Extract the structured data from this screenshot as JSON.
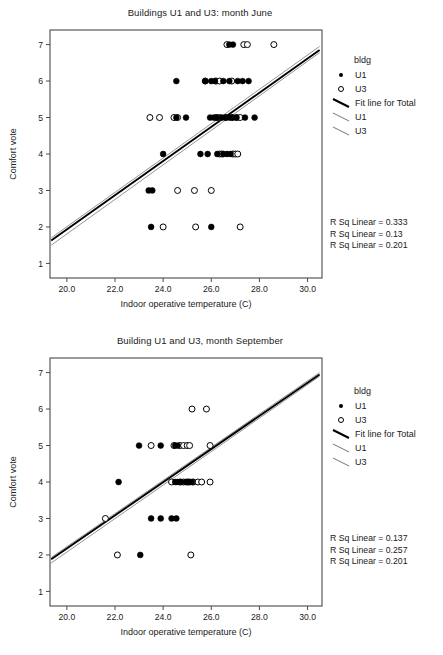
{
  "chart_data": [
    {
      "type": "scatter",
      "id": "june",
      "title": "Buildings U1 and U3: month June",
      "xlabel": "Indoor operative temperature (C)",
      "ylabel": "Comfort vote",
      "xlim": [
        19.3,
        30.6
      ],
      "ylim": [
        0.6,
        7.4
      ],
      "xticks": [
        "20.0",
        "22.0",
        "24.0",
        "26.0",
        "28.0",
        "30.0"
      ],
      "xtick_values": [
        20.0,
        22.0,
        24.0,
        26.0,
        28.0,
        30.0
      ],
      "yticks": [
        "1",
        "2",
        "3",
        "4",
        "5",
        "6",
        "7"
      ],
      "ytick_values": [
        1,
        2,
        3,
        4,
        5,
        6,
        7
      ],
      "grid": false,
      "legend": {
        "position": "right",
        "title": "bldg",
        "entries": [
          {
            "label": "U1",
            "marker": "filled-circle"
          },
          {
            "label": "U3",
            "marker": "open-circle"
          },
          {
            "label": "Fit line for Total",
            "marker": "thick-line"
          },
          {
            "label": "U1",
            "marker": "thin-line"
          },
          {
            "label": "U3",
            "marker": "thin-line"
          }
        ]
      },
      "annotations": [
        "R Sq Linear = 0.333",
        "R Sq Linear = 0.13",
        "R Sq Linear = 0.201"
      ],
      "series": [
        {
          "name": "U1",
          "marker": "filled-circle",
          "points": [
            [
              26.75,
              7
            ],
            [
              26.9,
              7
            ],
            [
              24.55,
              6
            ],
            [
              25.75,
              6
            ],
            [
              26.0,
              6
            ],
            [
              26.15,
              6
            ],
            [
              26.5,
              6
            ],
            [
              26.75,
              6
            ],
            [
              27.1,
              6
            ],
            [
              27.3,
              6
            ],
            [
              27.55,
              6
            ],
            [
              24.55,
              5
            ],
            [
              24.95,
              5
            ],
            [
              25.95,
              5
            ],
            [
              26.1,
              5
            ],
            [
              26.25,
              5
            ],
            [
              26.45,
              5
            ],
            [
              26.6,
              5
            ],
            [
              26.75,
              5
            ],
            [
              26.9,
              5
            ],
            [
              27.05,
              5
            ],
            [
              27.4,
              5
            ],
            [
              27.8,
              5
            ],
            [
              24.0,
              4
            ],
            [
              25.55,
              4
            ],
            [
              25.85,
              4
            ],
            [
              26.25,
              4
            ],
            [
              26.5,
              4
            ],
            [
              26.65,
              4
            ],
            [
              26.8,
              4
            ],
            [
              23.4,
              3
            ],
            [
              23.55,
              3
            ],
            [
              23.5,
              2
            ],
            [
              26.0,
              2
            ]
          ]
        },
        {
          "name": "U3",
          "marker": "open-circle",
          "points": [
            [
              26.65,
              7
            ],
            [
              27.35,
              7
            ],
            [
              27.5,
              7
            ],
            [
              28.6,
              7
            ],
            [
              25.75,
              6
            ],
            [
              26.2,
              6
            ],
            [
              26.35,
              6
            ],
            [
              26.85,
              6
            ],
            [
              23.45,
              5
            ],
            [
              23.85,
              5
            ],
            [
              24.45,
              5
            ],
            [
              24.6,
              5
            ],
            [
              26.2,
              5
            ],
            [
              26.35,
              5
            ],
            [
              26.6,
              5
            ],
            [
              26.85,
              5
            ],
            [
              27.05,
              5
            ],
            [
              27.2,
              5
            ],
            [
              26.35,
              4
            ],
            [
              26.45,
              4
            ],
            [
              26.9,
              4
            ],
            [
              27.0,
              4
            ],
            [
              27.1,
              4
            ],
            [
              24.6,
              3
            ],
            [
              25.3,
              3
            ],
            [
              26.0,
              3
            ],
            [
              24.0,
              2
            ],
            [
              25.35,
              2
            ],
            [
              27.2,
              2
            ]
          ]
        }
      ],
      "fit_lines": [
        {
          "name": "Fit line for Total",
          "style": "thick",
          "x0": 19.35,
          "y0": 1.63,
          "x1": 30.5,
          "y1": 6.85
        },
        {
          "name": "U1",
          "style": "thin",
          "x0": 19.35,
          "y0": 1.7,
          "x1": 30.5,
          "y1": 6.95
        },
        {
          "name": "U3",
          "style": "thin",
          "x0": 19.35,
          "y0": 1.5,
          "x1": 30.5,
          "y1": 6.78
        }
      ]
    },
    {
      "type": "scatter",
      "id": "september",
      "title": "Building U1 and U3, month September",
      "xlabel": "Indoor operative temperature (C)",
      "ylabel": "Comfort vote",
      "xlim": [
        19.3,
        30.6
      ],
      "ylim": [
        0.6,
        7.4
      ],
      "xticks": [
        "20.0",
        "22.0",
        "24.0",
        "26.0",
        "28.0",
        "30.0"
      ],
      "xtick_values": [
        20.0,
        22.0,
        24.0,
        26.0,
        28.0,
        30.0
      ],
      "yticks": [
        "1",
        "2",
        "3",
        "4",
        "5",
        "6",
        "7"
      ],
      "ytick_values": [
        1,
        2,
        3,
        4,
        5,
        6,
        7
      ],
      "grid": false,
      "legend": {
        "position": "right",
        "title": "bldg",
        "entries": [
          {
            "label": "U1",
            "marker": "filled-circle"
          },
          {
            "label": "U3",
            "marker": "open-circle"
          },
          {
            "label": "Fit line for Total",
            "marker": "thick-line"
          },
          {
            "label": "U1",
            "marker": "thin-line"
          },
          {
            "label": "U3",
            "marker": "thin-line"
          }
        ]
      },
      "annotations": [
        "R Sq Linear = 0.137",
        "R Sq Linear = 0.257",
        "R Sq Linear = 0.201"
      ],
      "series": [
        {
          "name": "U1",
          "marker": "filled-circle",
          "points": [
            [
              23.0,
              5
            ],
            [
              23.9,
              5
            ],
            [
              24.5,
              5
            ],
            [
              24.6,
              5
            ],
            [
              22.15,
              4
            ],
            [
              24.5,
              4
            ],
            [
              24.6,
              4
            ],
            [
              24.75,
              4
            ],
            [
              24.95,
              4
            ],
            [
              25.05,
              4
            ],
            [
              25.2,
              4
            ],
            [
              23.5,
              3
            ],
            [
              23.9,
              3
            ],
            [
              24.35,
              3
            ],
            [
              24.55,
              3
            ],
            [
              23.05,
              2
            ]
          ]
        },
        {
          "name": "U3",
          "marker": "open-circle",
          "points": [
            [
              25.2,
              6
            ],
            [
              25.8,
              6
            ],
            [
              23.5,
              5
            ],
            [
              24.45,
              5
            ],
            [
              24.7,
              5
            ],
            [
              24.85,
              5
            ],
            [
              25.0,
              5
            ],
            [
              25.1,
              5
            ],
            [
              25.95,
              5
            ],
            [
              24.35,
              4
            ],
            [
              24.7,
              4
            ],
            [
              24.85,
              4
            ],
            [
              25.0,
              4
            ],
            [
              25.1,
              4
            ],
            [
              25.25,
              4
            ],
            [
              25.45,
              4
            ],
            [
              25.6,
              4
            ],
            [
              25.95,
              4
            ],
            [
              21.6,
              3
            ],
            [
              22.1,
              2
            ],
            [
              25.15,
              2
            ]
          ]
        }
      ],
      "fit_lines": [
        {
          "name": "Fit line for Total",
          "style": "thick",
          "x0": 19.35,
          "y0": 1.88,
          "x1": 30.5,
          "y1": 6.95
        },
        {
          "name": "U1",
          "style": "thin",
          "x0": 19.35,
          "y0": 1.93,
          "x1": 30.5,
          "y1": 7.0
        },
        {
          "name": "U3",
          "style": "thin",
          "x0": 19.35,
          "y0": 1.78,
          "x1": 30.5,
          "y1": 6.9
        }
      ]
    }
  ]
}
